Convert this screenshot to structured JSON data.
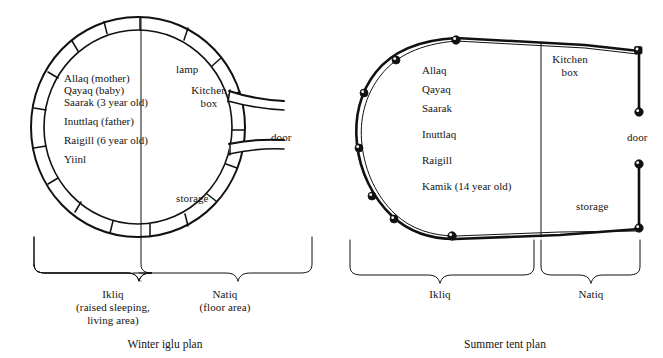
{
  "figure": {
    "title_winter": "Winter iglu plan",
    "title_summer": "Summer tent plan",
    "ink_color": "#111111",
    "paper_color": "#ffffff"
  },
  "winter_plan": {
    "caption": "Winter iglu plan",
    "occupants": [
      "Allaq (mother)",
      "Qayaq (baby)",
      "Saarak (3 year old)",
      "Inuttlaq (father)",
      "Raigill (6 year old)",
      "Yiinl"
    ],
    "features": {
      "lamp": "lamp",
      "kitchen_box_line1": "Kitchen",
      "kitchen_box_line2": "box",
      "storage": "storage",
      "door": "door"
    },
    "zones": [
      {
        "name": "Ikliq",
        "description_line1": "(raised sleeping,",
        "description_line2": "living area)"
      },
      {
        "name": "Natiq",
        "description_line1": "(floor area)",
        "description_line2": ""
      }
    ]
  },
  "summer_plan": {
    "caption": "Summer tent plan",
    "occupants": [
      "Allaq",
      "Qayaq",
      "Saarak",
      "Inuttlaq",
      "Raigill",
      "Kamik (14 year old)"
    ],
    "features": {
      "kitchen_box_line1": "Kitchen",
      "kitchen_box_line2": "box",
      "storage": "storage",
      "door": "door"
    },
    "zones": [
      {
        "name": "Ikliq"
      },
      {
        "name": "Natiq"
      }
    ]
  }
}
